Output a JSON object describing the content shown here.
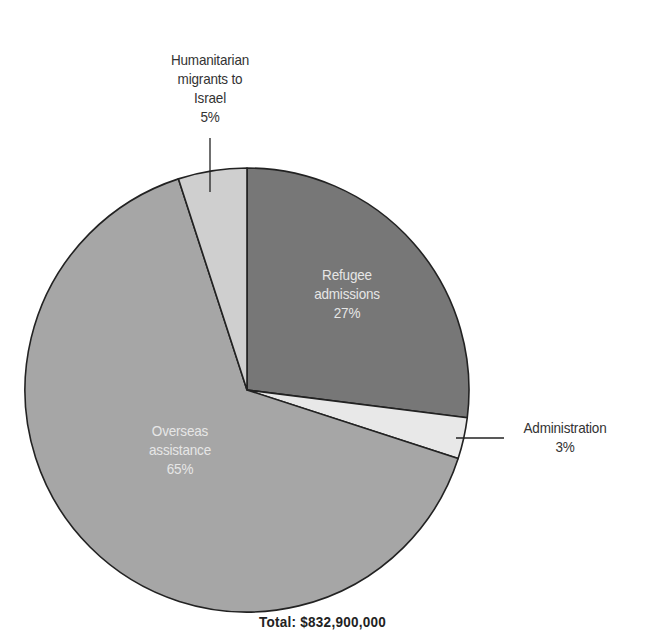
{
  "chart_data": {
    "type": "pie",
    "title": "",
    "total_label": "Total: $832,900,000",
    "total_value": 832900000,
    "start_angle_deg": 0,
    "direction": "clockwise",
    "slices": [
      {
        "name": "Refugee admissions",
        "lines": [
          "Refugee",
          "admissions",
          "27%"
        ],
        "percent": 27,
        "color": "#777777",
        "label_color": "#e6e6e6",
        "label_position": "inside"
      },
      {
        "name": "Administration",
        "lines": [
          "Administration",
          "3%"
        ],
        "percent": 3,
        "color": "#e8e8e8",
        "label_color": "#333333",
        "label_position": "outside"
      },
      {
        "name": "Overseas assistance",
        "lines": [
          "Overseas",
          "assistance",
          "65%"
        ],
        "percent": 65,
        "color": "#a6a6a6",
        "label_color": "#e6e6e6",
        "label_position": "inside"
      },
      {
        "name": "Humanitarian migrants to Israel",
        "lines": [
          "Humanitarian",
          "migrants to",
          "Israel",
          "5%"
        ],
        "percent": 5,
        "color": "#cfcfcf",
        "label_color": "#333333",
        "label_position": "outside"
      }
    ],
    "legend": "none",
    "grid": false
  },
  "labels": {
    "refugee": {
      "l1": "Refugee",
      "l2": "admissions",
      "l3": "27%"
    },
    "administration": {
      "l1": "Administration",
      "l2": "3%"
    },
    "overseas": {
      "l1": "Overseas",
      "l2": "assistance",
      "l3": "65%"
    },
    "humanitarian": {
      "l1": "Humanitarian",
      "l2": "migrants to",
      "l3": "Israel",
      "l4": "5%"
    }
  },
  "footer": {
    "total": "Total: $832,900,000"
  }
}
